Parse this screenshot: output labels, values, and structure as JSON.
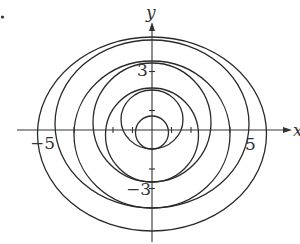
{
  "figure": {
    "marker_dot": {
      "cx": 2.5,
      "cy": 17,
      "r": 1.6
    },
    "origin_px": {
      "x": 152,
      "y": 130
    },
    "unit_px": 19.5,
    "axes": {
      "x_label": "x",
      "y_label": "y",
      "x_axis": {
        "x1": 17,
        "x2": 288,
        "y": 130
      },
      "y_axis": {
        "x": 152,
        "y1": 242,
        "y2": 26
      }
    },
    "tick_labels": {
      "x_neg": "−5",
      "x_pos": "5",
      "y_pos": "3",
      "y_neg": "−3"
    },
    "x_ticks_units": [
      -4,
      -2,
      -1,
      1,
      2,
      4
    ],
    "y_ticks_units": [
      3,
      1,
      -2,
      -3
    ],
    "curves": [
      {
        "name": "circle-innermost",
        "cx": 152,
        "cy": 132.5,
        "rx": 16.5,
        "ry": 16.5
      },
      {
        "name": "ellipse-2",
        "cx": 152,
        "cy": 119.5,
        "rx": 31,
        "ry": 29.5
      },
      {
        "name": "ellipse-3",
        "cx": 152,
        "cy": 135,
        "rx": 46.5,
        "ry": 47
      },
      {
        "name": "ellipse-4",
        "cx": 152,
        "cy": 122.5,
        "rx": 59,
        "ry": 59.5
      },
      {
        "name": "ellipse-5",
        "cx": 152,
        "cy": 134.5,
        "rx": 78,
        "ry": 73.5
      },
      {
        "name": "ellipse-6",
        "cx": 152,
        "cy": 124,
        "rx": 97,
        "ry": 84
      },
      {
        "name": "ellipse-7",
        "cx": 152,
        "cy": 134,
        "rx": 114.5,
        "ry": 97
      }
    ]
  }
}
